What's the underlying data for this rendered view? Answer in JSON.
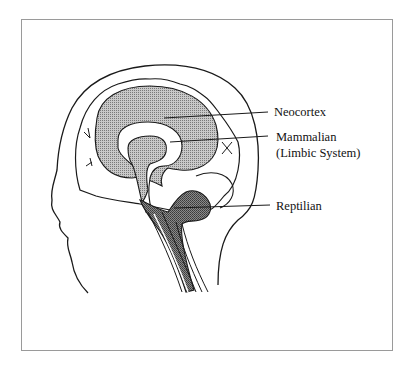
{
  "diagram": {
    "type": "triune-brain-sagittal",
    "colors": {
      "outline": "#1a1a1a",
      "neocortex_fill": "#a8a8a8",
      "reptilian_fill": "#6e6e6e",
      "frame": "#9a9a9a",
      "background": "#ffffff"
    },
    "labels": {
      "neocortex": "Neocortex",
      "mammalian": "Mammalian",
      "limbic": "(Limbic System)",
      "reptilian": "Reptilian"
    }
  }
}
